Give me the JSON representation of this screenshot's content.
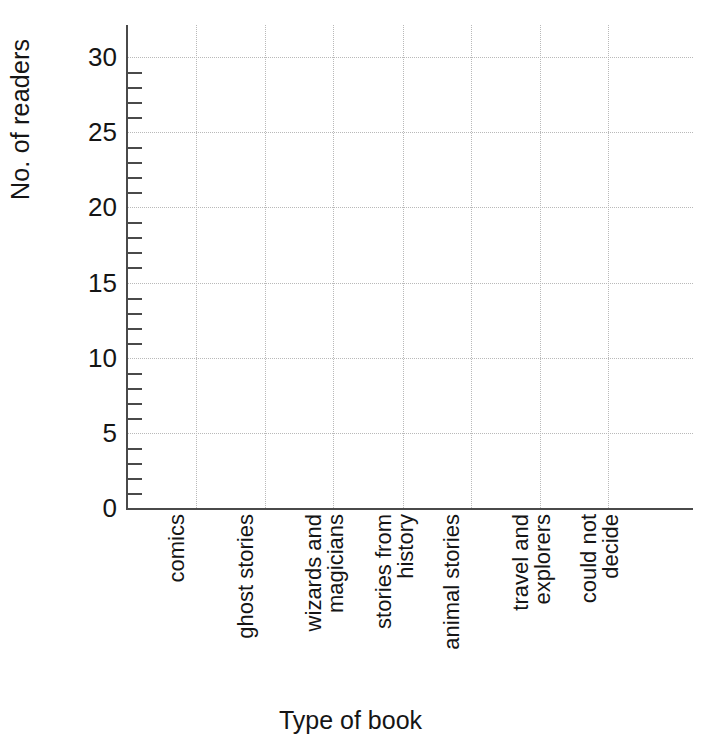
{
  "chart_data": {
    "type": "bar",
    "title": "",
    "xlabel": "Type of book",
    "ylabel": "No. of readers",
    "categories": [
      "comics",
      "ghost stories",
      "wizards and magicians",
      "stories from history",
      "animal stories",
      "travel and explorers",
      "could not decide"
    ],
    "category_lines": [
      [
        "comics"
      ],
      [
        "ghost stories"
      ],
      [
        "wizards and",
        "magicians"
      ],
      [
        "stories from",
        "history"
      ],
      [
        "animal stories"
      ],
      [
        "travel and",
        "explorers"
      ],
      [
        "could not",
        "decide"
      ]
    ],
    "values": [
      0,
      0,
      0,
      0,
      0,
      0,
      0
    ],
    "ylim": [
      0,
      31
    ],
    "ytick_labels": [
      "0",
      "5",
      "10",
      "15",
      "20",
      "25",
      "30"
    ],
    "ytick_values": [
      0,
      5,
      10,
      15,
      20,
      25,
      30
    ],
    "yminor_step": 1,
    "grid": "both",
    "legend": "none",
    "note": "Empty grid — axes and gridlines drawn, no bars plotted"
  },
  "axes": {
    "y_title": "No. of readers",
    "x_title": "Type of book"
  },
  "colors": {
    "background": "#ffffff",
    "axis": "#4a4a4a",
    "gridline": "#b9b9b9",
    "text": "#151515"
  }
}
